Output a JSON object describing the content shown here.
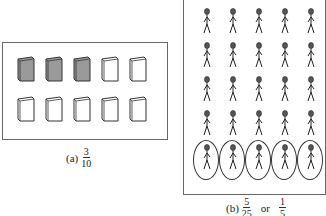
{
  "panel_a": {
    "books_total": 10,
    "books_shaded": 3,
    "rows": 2,
    "cols": 5,
    "caption": {
      "label": "(a)",
      "numerator": "3",
      "denominator": "10"
    }
  },
  "panel_b": {
    "people_total": 25,
    "people_circled": 5,
    "rows": 5,
    "cols": 5,
    "caption": {
      "label": "(b)",
      "numerator": "5",
      "denominator": "25",
      "connector": "or",
      "numerator2": "1",
      "denominator2": "5"
    }
  },
  "colors": {
    "shaded": "#9a9a9a",
    "outline": "#333333"
  }
}
